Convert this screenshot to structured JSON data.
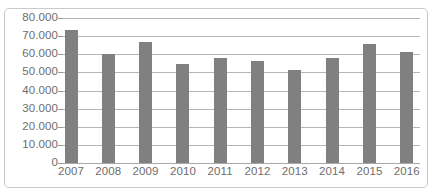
{
  "chart_data": {
    "type": "bar",
    "title": "",
    "subtitle": "",
    "xlabel": "",
    "ylabel": "",
    "categories": [
      "2007",
      "2008",
      "2009",
      "2010",
      "2011",
      "2012",
      "2013",
      "2014",
      "2015",
      "2016"
    ],
    "values": [
      73500,
      60000,
      67000,
      54500,
      58000,
      56500,
      51500,
      58000,
      65500,
      61000
    ],
    "ylim": [
      0,
      80000
    ],
    "ytick_values": [
      0,
      10000,
      20000,
      30000,
      40000,
      50000,
      60000,
      70000,
      80000
    ],
    "ytick_labels": [
      "0",
      "10.000",
      "20.000",
      "30.000",
      "40.000",
      "50.000",
      "60.000",
      "70.000",
      "80.000"
    ],
    "grid": true,
    "legend": null,
    "legend_position": "none",
    "series": [
      {
        "name": "",
        "values": [
          73500,
          60000,
          67000,
          54500,
          58000,
          56500,
          51500,
          58000,
          65500,
          61000
        ]
      }
    ]
  },
  "style": {
    "bar_color": "#808080",
    "gridline_color": "#b6b6b6",
    "axis_color": "#a8a8a8",
    "tick_label_color": "#6e6e6e",
    "frame_border_color": "#c9c9c9",
    "background_color": "#ffffff"
  }
}
